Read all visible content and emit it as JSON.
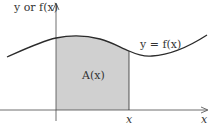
{
  "diagram": {
    "type": "area-under-curve",
    "y_axis_label": "y or f(x)",
    "curve_label": "y = f(x)",
    "area_label": "A(x)",
    "x_marker_label": "x",
    "x_axis_label": "x",
    "colors": {
      "background": "#ffffff",
      "curve": "#2b2b2b",
      "axes": "#4a4a4a",
      "shaded_area": "#d0d0d0",
      "text": "#333333"
    }
  }
}
